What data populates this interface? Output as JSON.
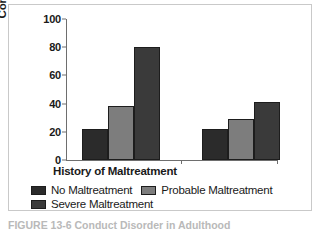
{
  "chart_data": {
    "type": "bar",
    "title": "",
    "xlabel": "History of Maltreatment",
    "ylabel": "Conduct Disorder in Adulthood",
    "ylabel_line1": "Conduct Disorder in",
    "ylabel_line2": "Adulthood",
    "ylim": [
      0,
      100
    ],
    "yticks": [
      100,
      80,
      60,
      40,
      20,
      0
    ],
    "grid": false,
    "legend_position": "bottom",
    "categories": [
      "Group 1",
      "Group 2"
    ],
    "series": [
      {
        "name": "No Maltreatment",
        "color": "#2b2b2b",
        "values": [
          22,
          22
        ]
      },
      {
        "name": "Probable Maltreatment",
        "color": "#7d7d7d",
        "values": [
          38,
          29
        ]
      },
      {
        "name": "Severe Maltreatment",
        "color": "#3a3a3a",
        "values": [
          80,
          41
        ]
      }
    ]
  },
  "legend": {
    "rows": [
      [
        {
          "label": "No Maltreatment",
          "color": "#2b2b2b"
        },
        {
          "label": "Probable Maltreatment",
          "color": "#7d7d7d"
        }
      ],
      [
        {
          "label": "Severe Maltreatment",
          "color": "#3a3a3a"
        }
      ]
    ]
  },
  "caption": {
    "text": "FIGURE 13-6  Conduct Disorder in Adulthood"
  }
}
